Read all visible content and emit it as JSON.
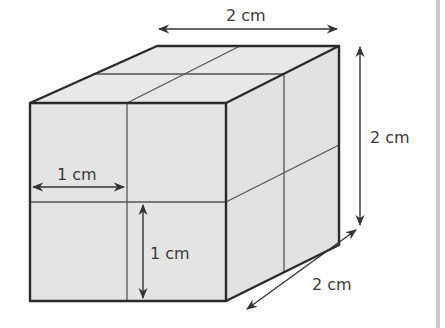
{
  "diagram": {
    "type": "cube-made-of-unit-cubes",
    "colors": {
      "face_fill": "#e4e4e4",
      "top_fill": "#e8e8e8",
      "side_fill": "#e2e2e2",
      "edge": "#2a2a2a",
      "grid_line": "#555555",
      "arrow": "#333333",
      "text": "#3a3a3a",
      "right_bar": "#c9c9c9"
    },
    "labels": {
      "top_width": "2 cm",
      "right_height": "2 cm",
      "depth": "2 cm",
      "unit_width": "1 cm",
      "unit_height": "1 cm"
    }
  }
}
